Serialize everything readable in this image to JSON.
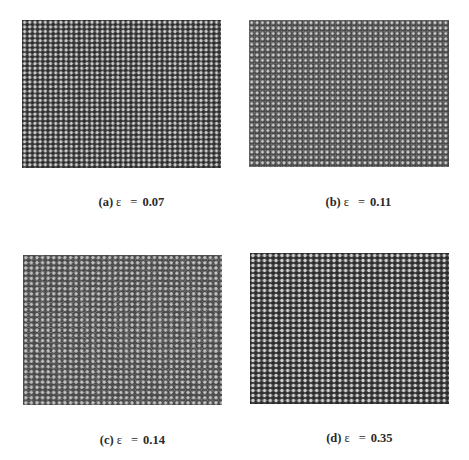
{
  "figure": {
    "panels": [
      {
        "id": "a",
        "label": "(a)",
        "symbol": "ε",
        "equals": "=",
        "value": "0.07",
        "pattern": "near-regular diagonal lattice"
      },
      {
        "id": "b",
        "label": "(b)",
        "symbol": "ε",
        "equals": "=",
        "value": "0.11",
        "pattern": "square cells with domain walls"
      },
      {
        "id": "c",
        "label": "(c)",
        "symbol": "ε",
        "equals": "=",
        "value": "0.14",
        "pattern": "mixed square and hexagonal domains"
      },
      {
        "id": "d",
        "label": "(d)",
        "symbol": "ε",
        "equals": "=",
        "value": "0.35",
        "pattern": "disordered hexagonal pattern"
      }
    ]
  }
}
